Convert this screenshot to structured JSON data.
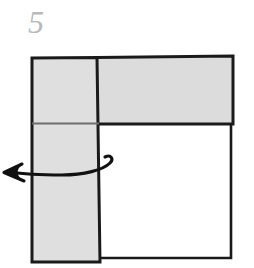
{
  "figure": {
    "type": "origami-fold-instruction-diagram",
    "step_label": "5",
    "step_label_color": "#b9b9b9",
    "background_color": "#ffffff",
    "paper_fill_color": "#dcdcdc",
    "paper_fill_color_light": "#e2e2e2",
    "outline_color": "#1a1a1a",
    "crease_color": "#6e6e6e",
    "arrow_color": "#111111",
    "parts": {
      "top_band": {
        "name": "top-horizontal-shaded-band",
        "fill": "#dcdcdc",
        "points": "97,57 233,56 233,124 97,124"
      },
      "left_flap": {
        "name": "left-vertical-shaded-flap",
        "fill": "#dcdcdc",
        "points": "32,57 97,57 100,262 32,262"
      },
      "lower_right_panel": {
        "name": "lower-right-white-panel",
        "fill": "#ffffff",
        "points": "100,124 231,124 231,258 100,258"
      },
      "crease_line": {
        "name": "horizontal-crease-line",
        "x1": 32,
        "y1": 123,
        "x2": 100,
        "y2": 123
      },
      "arrow": {
        "name": "fold-left-curved-arrow",
        "direction": "left",
        "head_tip": [
          4,
          173
        ],
        "loop_right_edge_x": 112
      }
    },
    "canvas": {
      "width": 254,
      "height": 268
    }
  }
}
